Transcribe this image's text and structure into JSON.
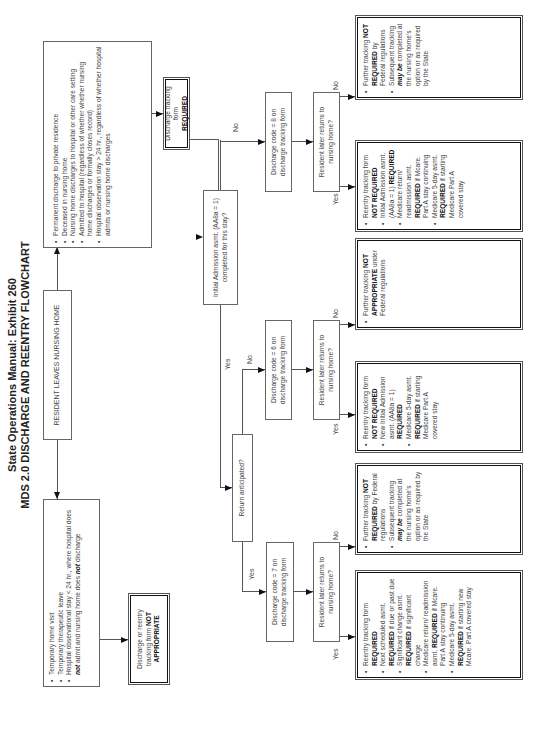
{
  "title": {
    "line1": "State Operations Manual:  Exhibit 260",
    "line2": "MDS 2.0 DISCHARGE AND REENTRY FLOWCHART"
  },
  "start": {
    "label": "RESIDENT LEAVES NURSING HOME"
  },
  "temporary_box": {
    "items": [
      "Temporary home visit",
      "Temporary therapeutic leave",
      "Hospital observational stay < 24 hr., where hospital does not admit and nursing home does not discharge"
    ]
  },
  "permanent_box": {
    "items": [
      "Permanent discharge to private residence",
      "Deceased in nursing home",
      "Nursing home discharges to hospital or other care setting",
      "Admitted to hospital (regardless of whether whether nursing home discharges or formally closes record)",
      "Hospital observation stay > 24 hr., regardless of whether hospital admits or nursing home discharges"
    ]
  },
  "not_appropriate_box": {
    "text": "Discharge or reentry tracking form",
    "bold": "NOT APPROPRIATE"
  },
  "discharge_required_box": {
    "text": "Discharge tracking form",
    "bold": "REQUIRED"
  },
  "decision_initial_admission": {
    "text": "Initial Admission asmt. (AA8a = 1) completed for this stay?"
  },
  "decision_return_anticipated": {
    "text": "Return anticipated?"
  },
  "code8": {
    "text": "Discharge code = 8 on discharge tracking form"
  },
  "code6": {
    "text": "Discharge code = 6 on discharge tracking form"
  },
  "code7": {
    "text": "Discharge code = 7 on discharge tracking form"
  },
  "returns_question": {
    "text": "Resident later returns to nursing home?"
  },
  "labels": {
    "yes": "Yes",
    "no": "No"
  },
  "outcome_code8_no": {
    "items": [
      [
        "Further tracking ",
        "NOT REQUIRED",
        " by Federal regulations"
      ],
      [
        "Subsequent tracking ",
        "may be",
        " completed at the nursing home's option or as required by the State"
      ]
    ]
  },
  "outcome_code8_yes": {
    "items": [
      [
        "Reentry tracking form ",
        "NOT REQUIRED",
        ""
      ],
      [
        "Initial Admission asmt. (AA8a = 1) ",
        "REQUIRED",
        ""
      ],
      [
        "Medicare return/ readmission asmt. ",
        "REQUIRED",
        " if Mcare. Part A stay continuing"
      ],
      [
        "Medicare 5-day asmt. ",
        "REQUIRED",
        " if starting Medicare Part A covered stay"
      ]
    ]
  },
  "outcome_code6_no": {
    "items": [
      [
        "Further tracking ",
        "NOT APPROPRIATE",
        " under Federal regulations"
      ]
    ]
  },
  "outcome_code6_yes": {
    "items": [
      [
        "Reentry tracking form ",
        "NOT REQUIRED",
        ""
      ],
      [
        "New Initial Admission asmt. (AA8a = 1) ",
        "REQUIRED",
        ""
      ],
      [
        "Medicare 5-day asmt. ",
        "REQUIRED",
        " if starting Medicare Part A covered stay"
      ]
    ]
  },
  "outcome_code7_no": {
    "items": [
      [
        "Further tracking ",
        "NOT REQUIRED",
        " by Federal regulations"
      ],
      [
        "Subsequent tracking ",
        "may be",
        " completed at the nursing home's option or as required by the State"
      ]
    ]
  },
  "outcome_code7_yes": {
    "items": [
      [
        "Reentry tracking form ",
        "REQUIRED",
        ""
      ],
      [
        "Next scheduled asmt. ",
        "REQUIRED",
        " if due or past due"
      ],
      [
        "Significant change asmt. ",
        "REQUIRED",
        " if significant change"
      ],
      [
        "Medicare return/ readmission asmt. ",
        "REQUIRED",
        " if Mcare. Part A stay continuing"
      ],
      [
        "Medicare 5-day asmt. ",
        "REQUIRED",
        " if starting new Mcare. Part A covered stay"
      ]
    ]
  }
}
